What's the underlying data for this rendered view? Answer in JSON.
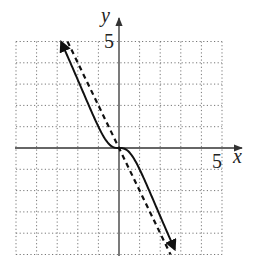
{
  "chart_data": {
    "type": "line",
    "title": "",
    "xlabel": "x",
    "ylabel": "y",
    "xlim": [
      -5,
      5
    ],
    "ylim": [
      -5,
      5
    ],
    "grid": true,
    "grid_style": "dotted",
    "grid_step": 1,
    "tick_labels": {
      "x": [
        "5"
      ],
      "y": [
        "5"
      ]
    },
    "series": [
      {
        "name": "curve",
        "style": "solid",
        "arrows": "both",
        "description": "Passes through origin with flat inflection; approaches the line y = -2x; approx y = -2x^3/(x^2+1)",
        "x": [
          -2.8,
          -2.0,
          -1.5,
          -1.0,
          -0.5,
          0,
          0.5,
          1.0,
          1.5,
          2.0,
          2.7
        ],
        "y": [
          5.0,
          3.2,
          2.1,
          1.0,
          0.2,
          0,
          -0.2,
          -1.0,
          -2.1,
          -3.2,
          -4.8
        ]
      },
      {
        "name": "asymptote",
        "style": "dashed",
        "description": "Slant asymptote y = -2x",
        "x": [
          -2.5,
          2.5
        ],
        "y": [
          5.0,
          -5.0
        ]
      }
    ]
  },
  "axes": {
    "x_label": "x",
    "y_label": "y",
    "x_tick": "5",
    "y_tick": "5"
  },
  "colors": {
    "curve": "#111111",
    "grid": "#777777",
    "axis": "#333333"
  }
}
